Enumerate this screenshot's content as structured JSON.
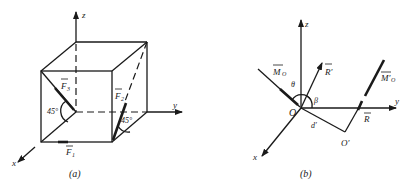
{
  "figure_a": {
    "caption": "(a)",
    "axes": {
      "x": "x",
      "y": "y",
      "z": "z"
    },
    "forces": [
      {
        "name": "F1",
        "label": "F",
        "sub": "1"
      },
      {
        "name": "F2",
        "label": "F",
        "sub": "2"
      },
      {
        "name": "F3",
        "label": "F",
        "sub": "3"
      }
    ],
    "angles": [
      "45°",
      "45°"
    ]
  },
  "figure_b": {
    "caption": "(b)",
    "axes": {
      "x": "x",
      "y": "y",
      "z": "z"
    },
    "origin": "O",
    "origin_prime": "O′",
    "vectors": {
      "moment": "M",
      "moment_sub": "O",
      "resultant_prime": "R′",
      "resultant": "R",
      "moment_prime": "M′",
      "moment_prime_sub": "O"
    },
    "angles": {
      "theta": "θ",
      "beta": "β"
    },
    "distance": "d′"
  },
  "colors": {
    "ink": "#1a1a1a",
    "background": "#ffffff"
  }
}
